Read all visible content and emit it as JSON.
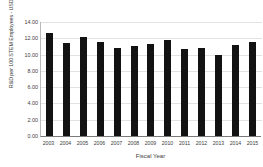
{
  "chart_data": {
    "type": "bar",
    "title": "",
    "xlabel": "Fiscal Year",
    "ylabel": "R&D per 100 STEM Employees - USDA",
    "categories": [
      "2003",
      "2004",
      "2005",
      "2006",
      "2007",
      "2008",
      "2009",
      "2010",
      "2011",
      "2012",
      "2013",
      "2014",
      "2015"
    ],
    "values": [
      12.6,
      11.45,
      12.1,
      11.6,
      10.75,
      11.0,
      11.35,
      11.85,
      10.65,
      10.75,
      9.95,
      11.2,
      11.5
    ],
    "ylim": [
      0,
      14
    ],
    "ytick_values": [
      0,
      2,
      4,
      6,
      8,
      10,
      12,
      14
    ],
    "ytick_labels": [
      "0.00",
      "2.00",
      "4.00",
      "6.00",
      "8.00",
      "10.00",
      "12.00",
      "14.00"
    ],
    "grid": true,
    "grid_axis": "y",
    "legend": false,
    "bar_color": "#121212",
    "gridline_color": "#e2e2e2",
    "axis_color": "#7a7a7a",
    "background_color": "#ffffff"
  }
}
